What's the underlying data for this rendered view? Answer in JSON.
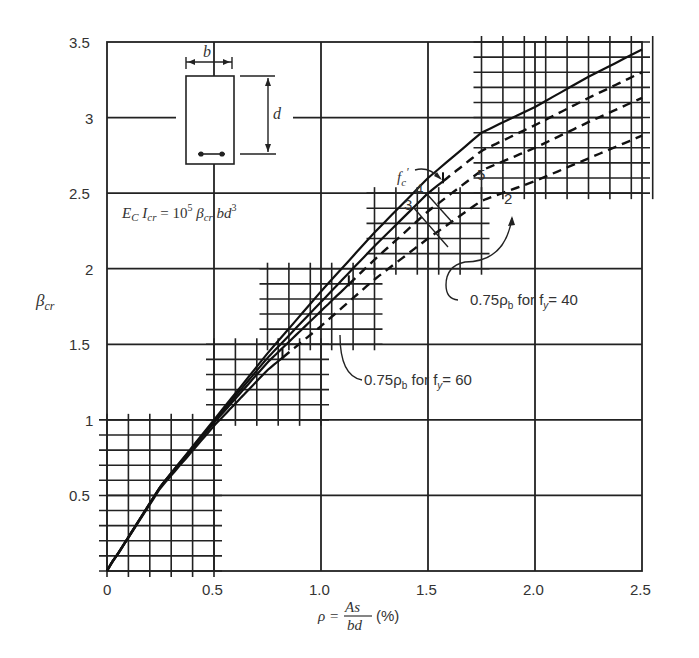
{
  "chart_data": {
    "type": "line",
    "title": "",
    "xlabel": "ρ = As/bd (%)",
    "ylabel": "βcr",
    "xlim": [
      0,
      2.5
    ],
    "ylim": [
      0,
      3.5
    ],
    "x_ticks": [
      "0",
      "0.5",
      "1.0",
      "1.5",
      "2.0",
      "2.5"
    ],
    "y_ticks": [
      "0.5",
      "1",
      "1.5",
      "2",
      "2.5",
      "3",
      "3.5"
    ],
    "grid": true,
    "formula": "Ec Icr = 10^5 βcr bd^3",
    "inset": {
      "width_label": "b",
      "depth_label": "d"
    },
    "legend_label": "f'c",
    "series": [
      {
        "name": "5",
        "x": [
          0,
          0.25,
          0.5,
          0.75,
          1.0,
          1.25,
          1.5,
          1.75,
          2.0,
          2.25,
          2.5
        ],
        "values": [
          0,
          0.56,
          1.0,
          1.44,
          1.85,
          2.24,
          2.6,
          2.9,
          3.07,
          3.27,
          3.45
        ],
        "dashed_from": null
      },
      {
        "name": "4",
        "x": [
          0,
          0.25,
          0.5,
          0.75,
          1.0,
          1.25,
          1.5,
          1.75,
          2.0,
          2.25,
          2.5
        ],
        "values": [
          0,
          0.56,
          0.99,
          1.41,
          1.78,
          2.15,
          2.5,
          2.78,
          2.95,
          3.13,
          3.3
        ],
        "dashed_from": 1.57
      },
      {
        "name": "3",
        "x": [
          0,
          0.25,
          0.5,
          0.75,
          1.0,
          1.25,
          1.5,
          1.75,
          2.0,
          2.25,
          2.5
        ],
        "values": [
          0,
          0.56,
          0.98,
          1.38,
          1.72,
          2.06,
          2.38,
          2.65,
          2.8,
          2.97,
          3.13
        ],
        "dashed_from": 1.13
      },
      {
        "name": "2",
        "x": [
          0,
          0.25,
          0.5,
          0.75,
          1.0,
          1.25,
          1.5,
          1.75,
          2.0,
          2.25,
          2.5
        ],
        "values": [
          0,
          0.55,
          0.96,
          1.33,
          1.62,
          1.93,
          2.2,
          2.45,
          2.58,
          2.73,
          2.88
        ],
        "dashed_from": 0.82
      }
    ],
    "annotations": [
      {
        "text": "0.75ρb for fy = 40",
        "points_to": "upper limit markers of solid segments"
      },
      {
        "text": "0.75ρb for fy = 60",
        "points_to": "lower limit markers of solid segments"
      }
    ]
  },
  "labels": {
    "x_axis_rho": "ρ =",
    "x_axis_num": "As",
    "x_axis_den": "bd",
    "x_axis_unit": "(%)",
    "y_axis": "β",
    "y_axis_sub": "cr",
    "formula_text": "E",
    "fc_label": "f",
    "inset_b": "b",
    "inset_d": "d",
    "ann40_a": "0.75ρ",
    "ann40_b": "b",
    "ann40_c": " for f",
    "ann40_d": "y",
    "ann40_e": "= 40",
    "ann60_a": "0.75ρ",
    "ann60_b": "b",
    "ann60_c": " for f",
    "ann60_d": "y",
    "ann60_e": "= 60",
    "curve_5": "5",
    "curve_4": "4",
    "curve_3": "3",
    "curve_2": "2"
  }
}
